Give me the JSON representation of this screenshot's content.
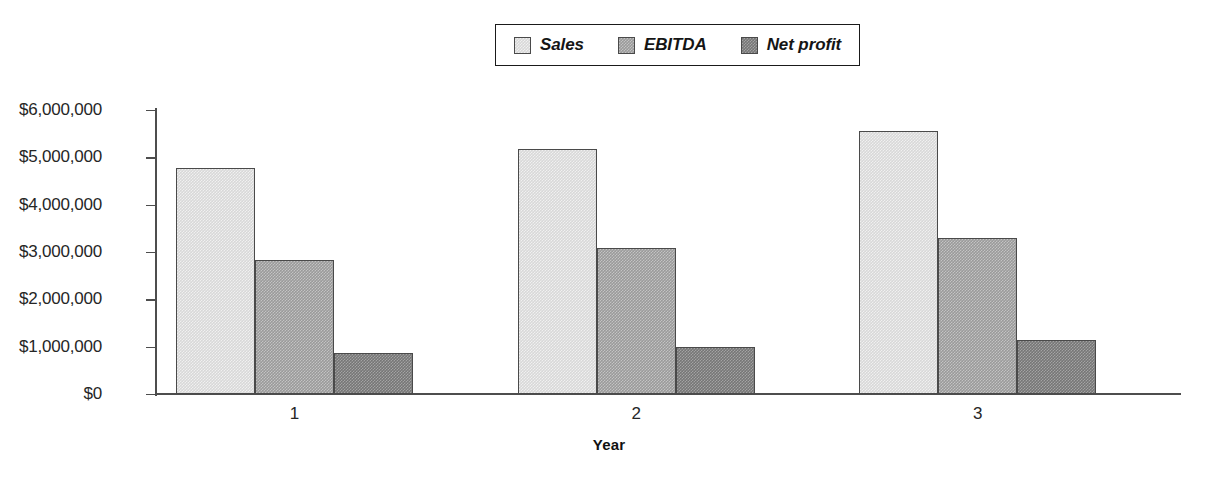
{
  "chart_data": {
    "type": "bar",
    "title": "",
    "xlabel": "Year",
    "ylabel": "",
    "categories": [
      "1",
      "2",
      "3"
    ],
    "series": [
      {
        "name": "Sales",
        "color": "#d8d8d8",
        "values": [
          4780000,
          5180000,
          5560000
        ]
      },
      {
        "name": "EBITDA",
        "color": "#9a9a9a",
        "values": [
          2840000,
          3080000,
          3300000
        ]
      },
      {
        "name": "Net profit",
        "color": "#767676",
        "values": [
          870000,
          990000,
          1140000
        ]
      }
    ],
    "ylim": [
      0,
      6000000
    ],
    "ytick_values": [
      6000000,
      5000000,
      4000000,
      3000000,
      2000000,
      1000000,
      0
    ],
    "ytick_labels": [
      "$6,000,000",
      "$5,000,000",
      "$4,000,000",
      "$3,000,000",
      "$2,000,000",
      "$1,000,000",
      "$0"
    ],
    "grid": false,
    "legend_position": "top-center",
    "orientation": "vertical",
    "grouping": "grouped"
  },
  "legend": {
    "items": [
      {
        "label": "Sales"
      },
      {
        "label": "EBITDA"
      },
      {
        "label": "Net profit"
      }
    ]
  }
}
